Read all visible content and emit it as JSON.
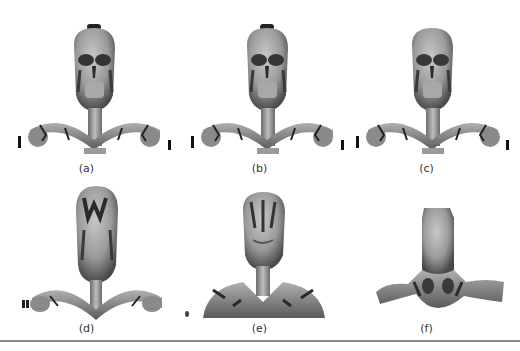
{
  "figure": {
    "panels": [
      {
        "id": "a",
        "caption": "(a)",
        "detail": "full"
      },
      {
        "id": "b",
        "caption": "(b)",
        "detail": "high"
      },
      {
        "id": "c",
        "caption": "(c)",
        "detail": "medium-high"
      },
      {
        "id": "d",
        "caption": "(d)",
        "detail": "medium"
      },
      {
        "id": "e",
        "caption": "(e)",
        "detail": "low"
      },
      {
        "id": "f",
        "caption": "(f)",
        "detail": "lowest"
      }
    ]
  },
  "colors": {
    "mesh_light": "#b8b8b8",
    "mesh_mid": "#8c8c8c",
    "mesh_dark": "#3a3a3a",
    "rule": "#8a8a8a",
    "caption": "#333333"
  }
}
